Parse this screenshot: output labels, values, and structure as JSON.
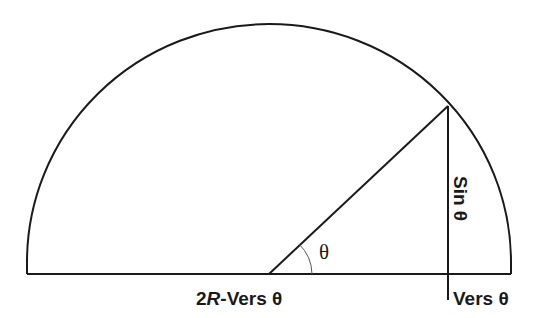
{
  "diagram": {
    "type": "semicircle-trigonometry",
    "labels": {
      "angle": "θ",
      "sine": "Sin θ",
      "versine": "Vers θ",
      "complement_prefix": "2",
      "complement_R": "R",
      "complement_suffix": "-Vers θ"
    },
    "colors": {
      "stroke": "#1a1a1a",
      "background": "#ffffff"
    }
  }
}
